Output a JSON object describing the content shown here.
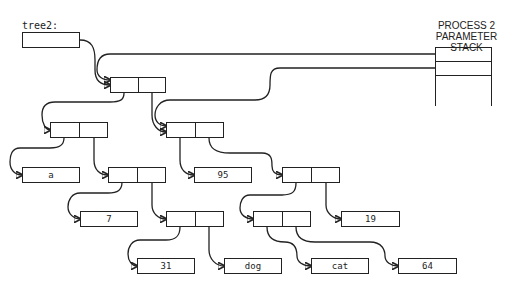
{
  "variable": {
    "label": "tree2:"
  },
  "stack": {
    "title_line1": "PROCESS 2",
    "title_line2": "PARAMETER STACK"
  },
  "leaves": {
    "a": "a",
    "n7": "7",
    "n95": "95",
    "n19": "19",
    "n31": "31",
    "dog": "dog",
    "cat": "cat",
    "n64": "64"
  },
  "colors": {
    "ink": "#222222",
    "background": "#ffffff"
  }
}
